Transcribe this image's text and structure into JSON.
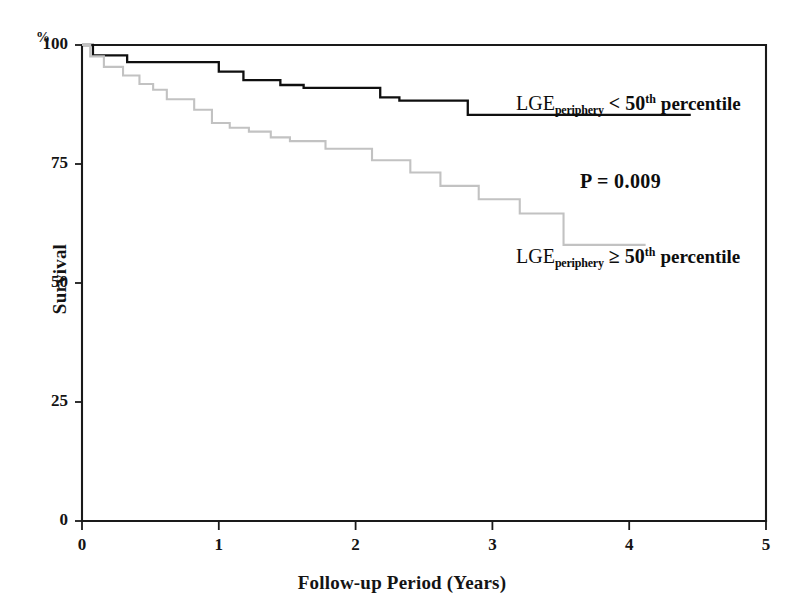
{
  "figure": {
    "kind": "kaplan-meier-survival-plot",
    "background_color": "#ffffff"
  },
  "axes": {
    "y_unit_symbol": "%",
    "y_title": "Survival",
    "x_title": "Follow-up Period (Years)",
    "y_ticks": [
      "0",
      "25",
      "50",
      "75",
      "100"
    ],
    "x_ticks": [
      "0",
      "1",
      "2",
      "3",
      "4",
      "5"
    ]
  },
  "annotations": {
    "p_value": "P = 0.009",
    "legend_upper": {
      "base": "LGE",
      "subscript": "periphery",
      "comparator": "<",
      "number": "50",
      "superscript": "th",
      "tail": "percentile"
    },
    "legend_lower": {
      "base": "LGE",
      "subscript": "periphery",
      "comparator": "≥",
      "number": "50",
      "superscript": "th",
      "tail": "percentile"
    }
  },
  "colors": {
    "curve_upper": "#0f0f0f",
    "curve_lower": "#c2c2c2",
    "axis": "#1a1a1a"
  },
  "chart_data": {
    "type": "line",
    "title": "",
    "xlabel": "Follow-up Period (Years)",
    "ylabel": "Survival",
    "y_unit": "%",
    "xlim": [
      0,
      5
    ],
    "ylim": [
      0,
      100
    ],
    "xticks": [
      0,
      1,
      2,
      3,
      4,
      5
    ],
    "yticks": [
      0,
      25,
      50,
      75,
      100
    ],
    "grid": false,
    "legend_position": "inside-right",
    "step_style": "post",
    "annotations": [
      {
        "text": "P = 0.009",
        "x": 3.65,
        "y": 72
      }
    ],
    "series": [
      {
        "name": "LGE_periphery < 50th percentile",
        "color": "#0f0f0f",
        "label_x": 3.2,
        "label_y": 86,
        "x": [
          0.0,
          0.08,
          0.08,
          0.33,
          0.33,
          1.0,
          1.0,
          1.18,
          1.18,
          1.45,
          1.45,
          1.62,
          1.62,
          2.18,
          2.18,
          2.32,
          2.32,
          2.82,
          2.82,
          4.45
        ],
        "y": [
          100.0,
          100.0,
          97.8,
          97.8,
          96.4,
          96.4,
          94.4,
          94.4,
          92.6,
          92.6,
          91.6,
          91.6,
          91.0,
          91.0,
          89.0,
          89.0,
          88.3,
          88.3,
          85.3,
          85.3
        ]
      },
      {
        "name": "LGE_periphery ≥ 50th percentile",
        "color": "#c2c2c2",
        "label_x": 3.2,
        "label_y": 53,
        "x": [
          0.0,
          0.06,
          0.06,
          0.16,
          0.16,
          0.3,
          0.3,
          0.42,
          0.42,
          0.52,
          0.52,
          0.62,
          0.62,
          0.82,
          0.82,
          0.95,
          0.95,
          1.08,
          1.08,
          1.22,
          1.22,
          1.38,
          1.38,
          1.52,
          1.52,
          1.78,
          1.78,
          2.12,
          2.12,
          2.4,
          2.4,
          2.62,
          2.62,
          2.9,
          2.9,
          3.2,
          3.2,
          3.52,
          3.52,
          4.12
        ],
        "y": [
          100.0,
          100.0,
          97.6,
          97.6,
          95.4,
          95.4,
          93.6,
          93.6,
          91.8,
          91.8,
          90.6,
          90.6,
          88.6,
          88.6,
          86.4,
          86.4,
          83.6,
          83.6,
          82.6,
          82.6,
          81.8,
          81.8,
          80.6,
          80.6,
          79.8,
          79.8,
          78.2,
          78.2,
          75.8,
          75.8,
          73.2,
          73.2,
          70.4,
          70.4,
          67.6,
          67.6,
          64.6,
          64.6,
          58.0,
          58.0
        ]
      }
    ]
  }
}
